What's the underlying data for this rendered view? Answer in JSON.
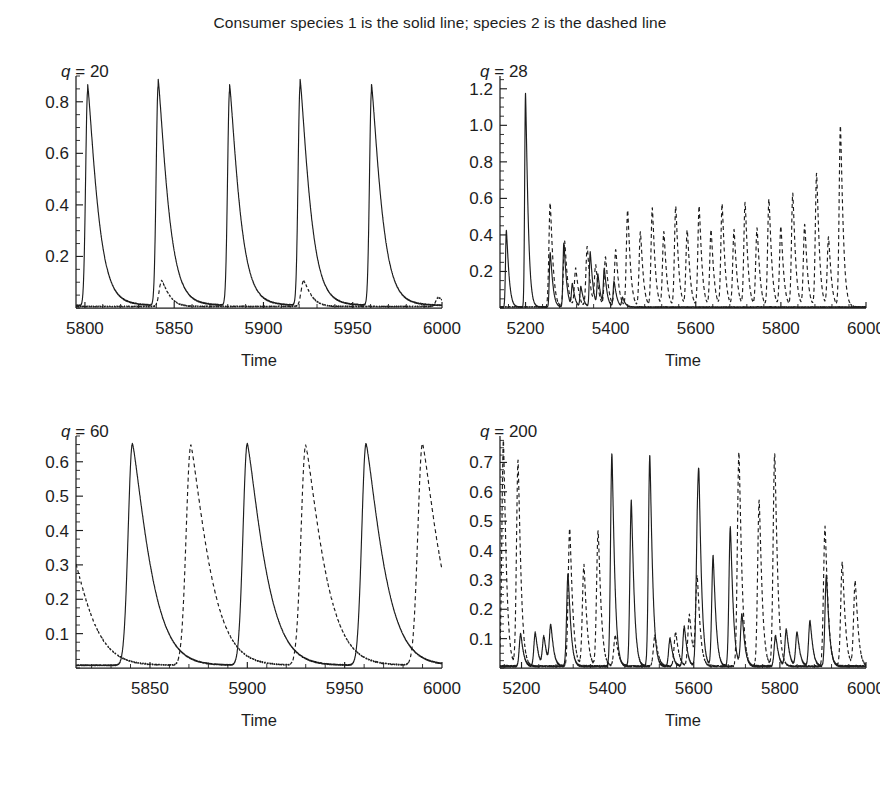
{
  "figure": {
    "title": "Consumer species 1 is the solid line; species 2 is the dashed line",
    "axis_title": "Time",
    "series_names": [
      "Consumer species 1",
      "Consumer species 2"
    ],
    "series_styles": [
      "solid",
      "dashed"
    ],
    "line_color": "#1d1d1d",
    "background_color": "#ffffff"
  },
  "panels": [
    {
      "id": "panel-q20",
      "label_var": "q",
      "label_eq": "=",
      "label_value": "20",
      "label_text": "q = 20",
      "xlabel": "Time",
      "ylabel": "",
      "xticks": [
        5800,
        5850,
        5900,
        5950,
        6000
      ],
      "xtick_labels": [
        "5800",
        "5850",
        "5900",
        "5950",
        "6000"
      ],
      "yticks": [
        0.2,
        0.4,
        0.6,
        0.8
      ],
      "ytick_labels": [
        "0.2",
        "0.4",
        "0.6",
        "0.8"
      ],
      "xlim": [
        5795,
        6000
      ],
      "ylim": [
        0,
        0.9
      ],
      "y_minor_step": 0.05,
      "x_minor_step": 10
    },
    {
      "id": "panel-q28",
      "label_var": "q",
      "label_eq": "=",
      "label_value": "28",
      "label_text": "q = 28",
      "xlabel": "Time",
      "ylabel": "",
      "xticks": [
        5200,
        5400,
        5600,
        5800,
        6000
      ],
      "xtick_labels": [
        "5200",
        "5400",
        "5600",
        "5800",
        "6000"
      ],
      "yticks": [
        0.2,
        0.4,
        0.6,
        0.8,
        1.0,
        1.2
      ],
      "ytick_labels": [
        "0.2",
        "0.4",
        "0.6",
        "0.8",
        "1.0",
        "1.2"
      ],
      "xlim": [
        5140,
        6000
      ],
      "ylim": [
        0,
        1.27
      ],
      "y_minor_step": 0.05,
      "x_minor_step": 40
    },
    {
      "id": "panel-q60",
      "label_var": "q",
      "label_eq": "=",
      "label_value": "60",
      "label_text": "q = 60",
      "xlabel": "Time",
      "ylabel": "",
      "xticks": [
        5850,
        5900,
        5950,
        6000
      ],
      "xtick_labels": [
        "5850",
        "5900",
        "5950",
        "6000"
      ],
      "yticks": [
        0.1,
        0.2,
        0.3,
        0.4,
        0.5,
        0.6
      ],
      "ytick_labels": [
        "0.1",
        "0.2",
        "0.3",
        "0.4",
        "0.5",
        "0.6"
      ],
      "xlim": [
        5812,
        6000
      ],
      "ylim": [
        0,
        0.675
      ],
      "y_minor_step": 0.025,
      "x_minor_step": 10
    },
    {
      "id": "panel-q200",
      "label_var": "q",
      "label_eq": "=",
      "label_value": "200",
      "label_text": "q = 200",
      "xlabel": "Time",
      "ylabel": "",
      "xticks": [
        5200,
        5400,
        5600,
        5800,
        6000
      ],
      "xtick_labels": [
        "5200",
        "5400",
        "5600",
        "5800",
        "6000"
      ],
      "yticks": [
        0.1,
        0.2,
        0.3,
        0.4,
        0.5,
        0.6,
        0.7
      ],
      "ytick_labels": [
        "0.1",
        "0.2",
        "0.3",
        "0.4",
        "0.5",
        "0.6",
        "0.7"
      ],
      "xlim": [
        5150,
        6000
      ],
      "ylim": [
        0,
        0.79
      ],
      "y_minor_step": 0.025,
      "x_minor_step": 40
    }
  ],
  "chart_data": [
    {
      "type": "line",
      "panel": "q = 20",
      "title": "q = 20",
      "xlabel": "Time",
      "ylabel": "",
      "xlim": [
        5795,
        6000
      ],
      "ylim": [
        0,
        0.9
      ],
      "grid": false,
      "legend": "none",
      "series": [
        {
          "name": "Consumer species 1",
          "style": "solid",
          "description": "Five tall regular spikes of amplitude ~0.83, period ~39.7, with fast rise and slow exponential decay to a low shoulder ~0.03.",
          "peaks": [
            {
              "x": 5801.5,
              "y": 0.83
            },
            {
              "x": 5841.0,
              "y": 0.85
            },
            {
              "x": 5881.0,
              "y": 0.83
            },
            {
              "x": 5920.5,
              "y": 0.85
            },
            {
              "x": 5960.5,
              "y": 0.83
            }
          ],
          "baseline": 0.01,
          "shoulder": 0.035
        },
        {
          "name": "Consumer species 2",
          "style": "dashed",
          "description": "Near zero throughout, with small bumps of ~0.10 just after the 2nd and 4th spikes of species 1.",
          "peaks": [
            {
              "x": 5843.0,
              "y": 0.1
            },
            {
              "x": 5922.5,
              "y": 0.1
            },
            {
              "x": 5998.0,
              "y": 0.035
            }
          ],
          "baseline": 0.006
        }
      ]
    },
    {
      "type": "line",
      "panel": "q = 28",
      "title": "q = 28",
      "xlabel": "Time",
      "ylabel": "",
      "xlim": [
        5140,
        6000
      ],
      "ylim": [
        0,
        1.27
      ],
      "grid": false,
      "legend": "none",
      "series": [
        {
          "name": "Consumer species 1",
          "style": "solid",
          "description": "Two large early spikes (0.42 at 5155, 1.17 at 5200) then a decaying irregular train of spikes that dies out around t = 5430.",
          "peaks": [
            {
              "x": 5155,
              "y": 0.42
            },
            {
              "x": 5200,
              "y": 1.17
            },
            {
              "x": 5258,
              "y": 0.3
            },
            {
              "x": 5290,
              "y": 0.35
            },
            {
              "x": 5310,
              "y": 0.12
            },
            {
              "x": 5330,
              "y": 0.11
            },
            {
              "x": 5352,
              "y": 0.3
            },
            {
              "x": 5370,
              "y": 0.17
            },
            {
              "x": 5385,
              "y": 0.2
            },
            {
              "x": 5408,
              "y": 0.14
            },
            {
              "x": 5428,
              "y": 0.05
            }
          ],
          "baseline": 0.005
        },
        {
          "name": "Consumer species 2",
          "style": "dashed",
          "description": "Emerges near t = 5250 and becomes the dominant oscillator: roughly 19 spikes whose amplitude first dips then grows, alternating tall/short pairs, culminating in a 0.99 spike near t = 5940.",
          "peaks": [
            {
              "x": 5258,
              "y": 0.57
            },
            {
              "x": 5292,
              "y": 0.36
            },
            {
              "x": 5318,
              "y": 0.21
            },
            {
              "x": 5345,
              "y": 0.33
            },
            {
              "x": 5365,
              "y": 0.22
            },
            {
              "x": 5388,
              "y": 0.27
            },
            {
              "x": 5412,
              "y": 0.31
            },
            {
              "x": 5440,
              "y": 0.53
            },
            {
              "x": 5470,
              "y": 0.41
            },
            {
              "x": 5498,
              "y": 0.54
            },
            {
              "x": 5525,
              "y": 0.41
            },
            {
              "x": 5553,
              "y": 0.55
            },
            {
              "x": 5580,
              "y": 0.42
            },
            {
              "x": 5608,
              "y": 0.55
            },
            {
              "x": 5636,
              "y": 0.42
            },
            {
              "x": 5662,
              "y": 0.56
            },
            {
              "x": 5690,
              "y": 0.42
            },
            {
              "x": 5716,
              "y": 0.57
            },
            {
              "x": 5744,
              "y": 0.43
            },
            {
              "x": 5772,
              "y": 0.59
            },
            {
              "x": 5800,
              "y": 0.44
            },
            {
              "x": 5828,
              "y": 0.62
            },
            {
              "x": 5856,
              "y": 0.45
            },
            {
              "x": 5884,
              "y": 0.73
            },
            {
              "x": 5912,
              "y": 0.38
            },
            {
              "x": 5940,
              "y": 0.99
            }
          ],
          "baseline": 0.006
        }
      ]
    },
    {
      "type": "line",
      "panel": "q = 60",
      "title": "q = 60",
      "xlabel": "Time",
      "ylabel": "",
      "xlim": [
        5812,
        6000
      ],
      "ylim": [
        0,
        0.675
      ],
      "grid": false,
      "legend": "none",
      "series": [
        {
          "name": "Consumer species 1",
          "style": "solid",
          "description": "Three broad spikes of amplitude ~0.64 at t = 5841, 5900, 5961 with period ~60; sharp rise and slow decay.",
          "peaks": [
            {
              "x": 5841,
              "y": 0.645
            },
            {
              "x": 5900,
              "y": 0.645
            },
            {
              "x": 5961,
              "y": 0.645
            }
          ],
          "baseline": 0.008
        },
        {
          "name": "Consumer species 2",
          "style": "dashed",
          "description": "Anti-phase with species 1: spikes of ~0.64 at t = 5871, 5930, 5990 plus a decaying tail from a peak just before the left edge (at ~5812 the curve is at 0.30 and falling).",
          "peaks": [
            {
              "x": 5810,
              "y": 0.33
            },
            {
              "x": 5871,
              "y": 0.64
            },
            {
              "x": 5930,
              "y": 0.64
            },
            {
              "x": 5990,
              "y": 0.645
            }
          ],
          "baseline": 0.008
        }
      ]
    },
    {
      "type": "line",
      "panel": "q = 200",
      "title": "q = 200",
      "xlabel": "Time",
      "ylabel": "",
      "xlim": [
        5150,
        6000
      ],
      "ylim": [
        0,
        0.79
      ],
      "grid": false,
      "legend": "none",
      "series": [
        {
          "name": "Consumer species 1",
          "style": "solid",
          "description": "Chaotic: long low wandering plateaus near 0.08-0.13 that ramp up to ~0.31, followed by bursts of very sharp spikes reaching 0.72-0.73.",
          "peaks": [
            {
              "x": 5198,
              "y": 0.11
            },
            {
              "x": 5232,
              "y": 0.115
            },
            {
              "x": 5252,
              "y": 0.1
            },
            {
              "x": 5268,
              "y": 0.135
            },
            {
              "x": 5308,
              "y": 0.315
            },
            {
              "x": 5410,
              "y": 0.725
            },
            {
              "x": 5455,
              "y": 0.565
            },
            {
              "x": 5498,
              "y": 0.72
            },
            {
              "x": 5545,
              "y": 0.095
            },
            {
              "x": 5578,
              "y": 0.135
            },
            {
              "x": 5608,
              "y": 0.315
            },
            {
              "x": 5612,
              "y": 0.465
            },
            {
              "x": 5645,
              "y": 0.375
            },
            {
              "x": 5685,
              "y": 0.475
            },
            {
              "x": 5712,
              "y": 0.175
            },
            {
              "x": 5790,
              "y": 0.105
            },
            {
              "x": 5815,
              "y": 0.125
            },
            {
              "x": 5840,
              "y": 0.115
            },
            {
              "x": 5870,
              "y": 0.155
            },
            {
              "x": 5908,
              "y": 0.31
            }
          ],
          "baseline": 0.006
        },
        {
          "name": "Consumer species 2",
          "style": "dashed",
          "description": "Chaotic counterpart: sharp isolated spikes ranging 0.28-0.77, tallest at the left edge (0.77) and near t = 5710 and 5790 (~0.73).",
          "peaks": [
            {
              "x": 5158,
              "y": 0.77
            },
            {
              "x": 5192,
              "y": 0.7
            },
            {
              "x": 5312,
              "y": 0.47
            },
            {
              "x": 5345,
              "y": 0.345
            },
            {
              "x": 5378,
              "y": 0.46
            },
            {
              "x": 5418,
              "y": 0.105
            },
            {
              "x": 5510,
              "y": 0.105
            },
            {
              "x": 5558,
              "y": 0.115
            },
            {
              "x": 5590,
              "y": 0.175
            },
            {
              "x": 5608,
              "y": 0.3
            },
            {
              "x": 5705,
              "y": 0.73
            },
            {
              "x": 5752,
              "y": 0.565
            },
            {
              "x": 5788,
              "y": 0.725
            },
            {
              "x": 5905,
              "y": 0.475
            },
            {
              "x": 5945,
              "y": 0.355
            },
            {
              "x": 5975,
              "y": 0.29
            }
          ],
          "baseline": 0.006
        }
      ]
    }
  ]
}
